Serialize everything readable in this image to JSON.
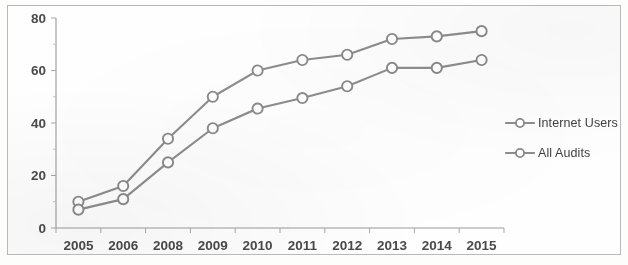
{
  "chart_data": {
    "type": "line",
    "title": "",
    "subtitle": "",
    "xlabel": "",
    "ylabel": "",
    "categories": [
      "2005",
      "2006",
      "2008",
      "2009",
      "2010",
      "2011",
      "2012",
      "2013",
      "2014",
      "2015"
    ],
    "series": [
      {
        "name": "Internet Users",
        "values": [
          10,
          16,
          34,
          50,
          60,
          64,
          66,
          72,
          73,
          75
        ],
        "color": "#8d8d8d",
        "marker": "open-circle"
      },
      {
        "name": "All Audits",
        "values": [
          7,
          11,
          25,
          38,
          45.5,
          49.5,
          54,
          61,
          61,
          64
        ],
        "color": "#8d8d8d",
        "marker": "open-circle"
      }
    ],
    "ylim": [
      0,
      80
    ],
    "y_ticks": [
      0,
      20,
      40,
      60,
      80
    ],
    "y_minor_ticks": [
      10,
      30,
      50,
      70
    ],
    "grid": false,
    "legend_position": "right",
    "axis_color": "#9a9a9a"
  },
  "legend": {
    "items": [
      {
        "label": "Internet Users"
      },
      {
        "label": "All Audits"
      }
    ]
  }
}
